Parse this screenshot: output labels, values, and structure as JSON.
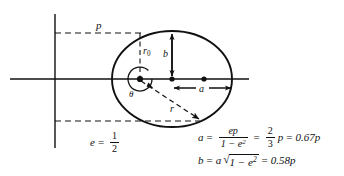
{
  "figure": {
    "type": "geometry-diagram",
    "labels": {
      "semi_latus_rectum": "p",
      "focal_radius_at_90deg": "r",
      "focal_radius_subscript": "0",
      "semi_minor_axis": "b",
      "semi_major_axis": "a",
      "radius_vector": "r",
      "polar_angle": "θ"
    },
    "equations": {
      "eccentricity": {
        "lhs": "e",
        "equals": "=",
        "numerator": "1",
        "denominator": "2"
      },
      "semi_major": {
        "lhs": "a",
        "equals_1": "=",
        "frac_numerator": "ep",
        "frac_denominator_base": "1 − e",
        "frac_denominator_exp": "2",
        "equals_2": "=",
        "ratio_numerator": "2",
        "ratio_denominator": "3",
        "ratio_var": "p",
        "equals_3": "=",
        "result": "0.67p"
      },
      "semi_minor": {
        "lhs": "b",
        "equals_1": "=",
        "coefficient": "a",
        "radical_sign": "√",
        "radicand_base": "1 − e",
        "radicand_exp": "2",
        "equals_2": "=",
        "result": "0.58p"
      }
    },
    "geometry": {
      "ellipse_center_x": 172,
      "ellipse_center_y": 79,
      "semi_major_px": 60,
      "semi_minor_px": 48,
      "focus_left_x": 140,
      "focus_right_x": 204,
      "directrix_x": 55,
      "axis_y": 79,
      "p_line_y": 33,
      "bottom_dash_y": 121
    },
    "colors": {
      "ink": "#111111",
      "background": "#ffffff"
    }
  }
}
